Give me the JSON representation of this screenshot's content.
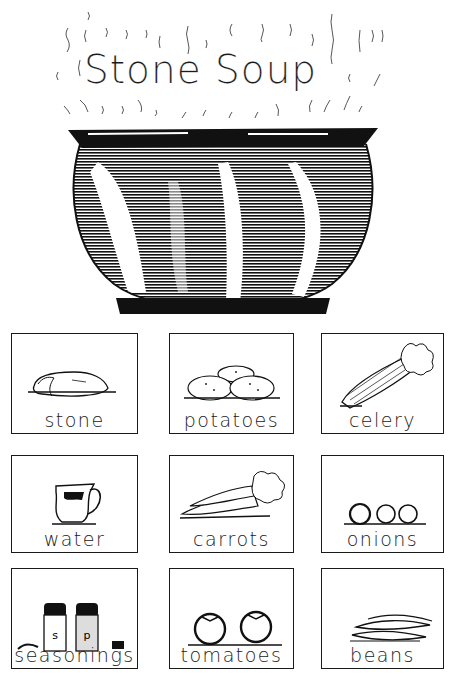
{
  "worksheet": {
    "title": "Stone Soup",
    "illustration": "steaming-pot",
    "cards": [
      {
        "label": "stone",
        "icon": "stone-icon"
      },
      {
        "label": "potatoes",
        "icon": "potatoes-icon"
      },
      {
        "label": "celery",
        "icon": "celery-icon"
      },
      {
        "label": "water",
        "icon": "water-pitcher-icon"
      },
      {
        "label": "carrots",
        "icon": "carrots-icon"
      },
      {
        "label": "onions",
        "icon": "onions-icon"
      },
      {
        "label": "seasonings",
        "icon": "salt-pepper-shakers-icon",
        "shaker_letters": [
          "s",
          "p"
        ]
      },
      {
        "label": "tomatoes",
        "icon": "tomatoes-icon"
      },
      {
        "label": "beans",
        "icon": "beans-icon"
      }
    ]
  }
}
